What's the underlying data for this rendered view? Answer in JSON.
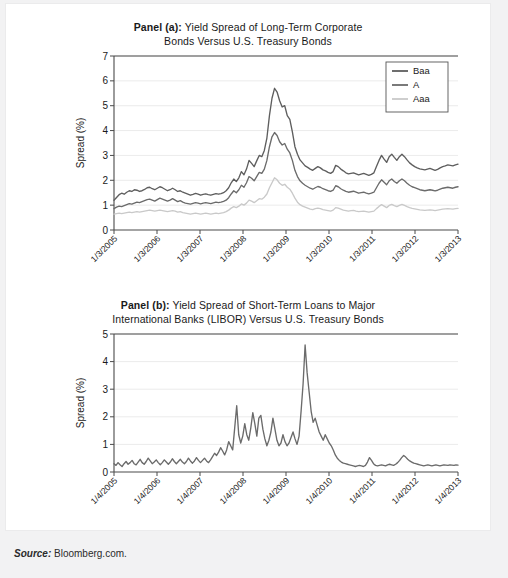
{
  "figure": {
    "source_label": "Source:",
    "source_text": " Bloomberg.com."
  },
  "panel_a": {
    "title_prefix": "Panel (a):",
    "title_line1": " Yield Spread of Long-Term Corporate",
    "title_line2": "Bonds Versus U.S. Treasury Bonds"
  },
  "panel_b": {
    "title_prefix": "Panel (b):",
    "title_line1": " Yield Spread of Short-Term Loans to Major",
    "title_line2": "International Banks (LIBOR) Versus U.S. Treasury Bonds"
  },
  "colors": {
    "baa": "#5e5e5e",
    "a": "#6b6b6b",
    "aaa": "#c9c9c9",
    "axis": "#4a4a4a",
    "grid": "#e6e6e6",
    "page": "#ffffff",
    "backdrop": "#f2f2f3"
  },
  "chart_data": [
    {
      "type": "line",
      "title": "Panel (a): Yield Spread of Long-Term Corporate Bonds Versus U.S. Treasury Bonds",
      "xlabel": "",
      "ylabel": "Spread (%)",
      "ylim": [
        0,
        7
      ],
      "yticks": [
        0,
        1,
        2,
        3,
        4,
        5,
        6,
        7
      ],
      "grid": true,
      "legend": [
        "Baa",
        "A",
        "Aaa"
      ],
      "legend_position": "top-right",
      "x": [
        "1/3/2005",
        "1/3/2006",
        "1/3/2007",
        "1/3/2008",
        "1/3/2009",
        "1/3/2010",
        "1/3/2011",
        "1/3/2012",
        "1/3/2013"
      ],
      "xticks": [
        "1/3/2005",
        "1/3/2006",
        "1/3/2007",
        "1/3/2008",
        "1/3/2009",
        "1/3/2010",
        "1/3/2011",
        "1/3/2012",
        "1/3/2013"
      ],
      "series": [
        {
          "name": "Baa",
          "color": "#5e5e5e",
          "values": [
            1.2,
            1.31,
            1.42,
            1.48,
            1.44,
            1.52,
            1.58,
            1.55,
            1.62,
            1.6,
            1.55,
            1.58,
            1.63,
            1.7,
            1.72,
            1.66,
            1.62,
            1.68,
            1.74,
            1.7,
            1.64,
            1.58,
            1.62,
            1.68,
            1.62,
            1.55,
            1.58,
            1.52,
            1.48,
            1.44,
            1.4,
            1.43,
            1.47,
            1.44,
            1.4,
            1.43,
            1.45,
            1.42,
            1.4,
            1.43,
            1.46,
            1.44,
            1.46,
            1.5,
            1.58,
            1.7,
            1.9,
            2.05,
            1.95,
            2.1,
            2.35,
            2.22,
            2.45,
            2.8,
            2.68,
            2.55,
            2.78,
            3.0,
            2.95,
            3.2,
            3.7,
            4.6,
            5.3,
            5.7,
            5.55,
            5.2,
            4.95,
            5.0,
            4.6,
            4.45,
            3.95,
            3.35,
            3.05,
            2.82,
            2.7,
            2.58,
            2.52,
            2.45,
            2.4,
            2.48,
            2.55,
            2.5,
            2.42,
            2.38,
            2.32,
            2.28,
            2.35,
            2.6,
            2.55,
            2.45,
            2.38,
            2.3,
            2.26,
            2.28,
            2.3,
            2.26,
            2.22,
            2.25,
            2.28,
            2.24,
            2.2,
            2.24,
            2.3,
            2.55,
            2.8,
            3.0,
            2.85,
            2.72,
            2.95,
            3.05,
            2.92,
            2.8,
            2.95,
            3.05,
            2.95,
            2.82,
            2.7,
            2.62,
            2.55,
            2.5,
            2.46,
            2.44,
            2.42,
            2.45,
            2.48,
            2.44,
            2.4,
            2.44,
            2.5,
            2.55,
            2.58,
            2.62,
            2.6,
            2.58,
            2.62,
            2.65
          ]
        },
        {
          "name": "A",
          "color": "#6b6b6b",
          "values": [
            0.86,
            0.92,
            0.96,
            0.94,
            0.98,
            1.02,
            1.06,
            1.04,
            1.08,
            1.12,
            1.1,
            1.14,
            1.18,
            1.22,
            1.24,
            1.2,
            1.16,
            1.22,
            1.28,
            1.24,
            1.2,
            1.16,
            1.2,
            1.26,
            1.2,
            1.14,
            1.18,
            1.12,
            1.08,
            1.06,
            1.04,
            1.07,
            1.1,
            1.08,
            1.05,
            1.08,
            1.1,
            1.08,
            1.06,
            1.09,
            1.12,
            1.1,
            1.12,
            1.15,
            1.2,
            1.3,
            1.45,
            1.58,
            1.5,
            1.62,
            1.8,
            1.72,
            1.9,
            2.15,
            2.08,
            1.98,
            2.15,
            2.32,
            2.28,
            2.45,
            2.8,
            3.35,
            3.75,
            3.92,
            3.8,
            3.55,
            3.42,
            3.48,
            3.25,
            3.1,
            2.8,
            2.4,
            2.15,
            1.98,
            1.88,
            1.8,
            1.74,
            1.68,
            1.64,
            1.7,
            1.75,
            1.72,
            1.66,
            1.62,
            1.58,
            1.55,
            1.6,
            1.78,
            1.74,
            1.66,
            1.6,
            1.55,
            1.52,
            1.54,
            1.56,
            1.52,
            1.48,
            1.5,
            1.52,
            1.48,
            1.45,
            1.48,
            1.52,
            1.7,
            1.88,
            2.02,
            1.92,
            1.82,
            1.98,
            2.05,
            1.95,
            1.88,
            1.98,
            2.05,
            1.98,
            1.88,
            1.8,
            1.74,
            1.7,
            1.66,
            1.62,
            1.6,
            1.58,
            1.6,
            1.62,
            1.6,
            1.57,
            1.6,
            1.64,
            1.68,
            1.7,
            1.72,
            1.7,
            1.68,
            1.72,
            1.74
          ]
        },
        {
          "name": "Aaa",
          "color": "#c9c9c9",
          "values": [
            0.64,
            0.66,
            0.68,
            0.66,
            0.68,
            0.7,
            0.72,
            0.7,
            0.72,
            0.74,
            0.72,
            0.74,
            0.76,
            0.78,
            0.8,
            0.78,
            0.76,
            0.78,
            0.8,
            0.78,
            0.76,
            0.74,
            0.76,
            0.78,
            0.76,
            0.72,
            0.74,
            0.7,
            0.68,
            0.66,
            0.64,
            0.66,
            0.68,
            0.66,
            0.64,
            0.66,
            0.68,
            0.66,
            0.64,
            0.66,
            0.68,
            0.66,
            0.68,
            0.7,
            0.74,
            0.8,
            0.88,
            0.94,
            0.9,
            0.96,
            1.05,
            1.0,
            1.08,
            1.2,
            1.16,
            1.1,
            1.18,
            1.26,
            1.24,
            1.32,
            1.45,
            1.7,
            1.9,
            2.1,
            2.02,
            1.88,
            1.8,
            1.84,
            1.72,
            1.64,
            1.48,
            1.28,
            1.12,
            1.02,
            0.96,
            0.92,
            0.88,
            0.84,
            0.82,
            0.86,
            0.88,
            0.86,
            0.82,
            0.8,
            0.78,
            0.76,
            0.8,
            0.9,
            0.88,
            0.84,
            0.8,
            0.78,
            0.76,
            0.78,
            0.79,
            0.76,
            0.74,
            0.75,
            0.76,
            0.74,
            0.72,
            0.74,
            0.76,
            0.86,
            0.95,
            1.02,
            0.96,
            0.9,
            0.99,
            1.03,
            0.98,
            0.94,
            0.99,
            1.03,
            0.99,
            0.94,
            0.9,
            0.87,
            0.85,
            0.83,
            0.81,
            0.8,
            0.79,
            0.8,
            0.81,
            0.8,
            0.78,
            0.8,
            0.82,
            0.84,
            0.85,
            0.86,
            0.85,
            0.84,
            0.86,
            0.87
          ]
        }
      ]
    },
    {
      "type": "line",
      "title": "Panel (b): Yield Spread of Short-Term Loans to Major International Banks (LIBOR) Versus U.S. Treasury Bonds",
      "xlabel": "",
      "ylabel": "Spread (%)",
      "ylim": [
        0,
        5
      ],
      "yticks": [
        0,
        1,
        2,
        3,
        4,
        5
      ],
      "grid": true,
      "legend": [],
      "x": [
        "1/4/2005",
        "1/4/2006",
        "1/4/2007",
        "1/4/2008",
        "1/4/2009",
        "1/4/2010",
        "1/4/2011",
        "1/4/2012",
        "1/4/2013"
      ],
      "xticks": [
        "1/4/2005",
        "1/4/2006",
        "1/4/2007",
        "1/4/2008",
        "1/4/2009",
        "1/4/2010",
        "1/4/2011",
        "1/4/2012",
        "1/4/2013"
      ],
      "series": [
        {
          "name": "LIBOR spread",
          "color": "#6b6b6b",
          "values": [
            0.3,
            0.24,
            0.34,
            0.26,
            0.2,
            0.3,
            0.38,
            0.28,
            0.34,
            0.42,
            0.3,
            0.26,
            0.36,
            0.46,
            0.34,
            0.28,
            0.38,
            0.5,
            0.4,
            0.3,
            0.36,
            0.44,
            0.34,
            0.26,
            0.34,
            0.44,
            0.36,
            0.28,
            0.36,
            0.48,
            0.38,
            0.3,
            0.38,
            0.46,
            0.36,
            0.3,
            0.38,
            0.5,
            0.4,
            0.32,
            0.4,
            0.52,
            0.42,
            0.34,
            0.42,
            0.5,
            0.4,
            0.34,
            0.44,
            0.56,
            0.68,
            0.6,
            0.72,
            0.88,
            0.76,
            0.62,
            0.8,
            1.1,
            0.95,
            0.8,
            1.6,
            2.4,
            1.35,
            1.05,
            1.3,
            1.75,
            1.35,
            1.15,
            1.6,
            2.15,
            1.75,
            1.3,
            1.95,
            2.05,
            1.55,
            1.2,
            0.95,
            1.15,
            1.45,
            1.95,
            1.55,
            1.15,
            0.95,
            1.05,
            1.35,
            1.1,
            0.95,
            1.05,
            1.25,
            1.45,
            1.2,
            1.0,
            1.3,
            2.2,
            3.2,
            4.6,
            3.6,
            2.9,
            2.2,
            1.8,
            1.95,
            1.7,
            1.45,
            1.3,
            1.15,
            1.35,
            1.2,
            1.05,
            0.95,
            0.8,
            0.62,
            0.5,
            0.42,
            0.36,
            0.32,
            0.3,
            0.28,
            0.26,
            0.24,
            0.22,
            0.2,
            0.22,
            0.24,
            0.22,
            0.2,
            0.24,
            0.36,
            0.52,
            0.42,
            0.3,
            0.24,
            0.22,
            0.24,
            0.26,
            0.24,
            0.22,
            0.26,
            0.28,
            0.26,
            0.24,
            0.28,
            0.34,
            0.42,
            0.52,
            0.6,
            0.54,
            0.46,
            0.4,
            0.36,
            0.32,
            0.3,
            0.28,
            0.26,
            0.24,
            0.22,
            0.24,
            0.26,
            0.24,
            0.22,
            0.24,
            0.26,
            0.24,
            0.22,
            0.24,
            0.26,
            0.25,
            0.24,
            0.26,
            0.25,
            0.24,
            0.26,
            0.25
          ]
        }
      ]
    }
  ]
}
